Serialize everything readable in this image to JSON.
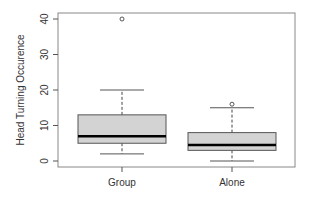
{
  "chart_data": {
    "type": "boxplot",
    "title": "",
    "xlabel": "",
    "ylabel": "Head Turning Occurence",
    "ylim": [
      -1.5,
      42
    ],
    "yticks": [
      0,
      10,
      20,
      30,
      40
    ],
    "ytick_labels": [
      "0",
      "10",
      "20",
      "30",
      "40"
    ],
    "grid": false,
    "legend": null,
    "categories": [
      "Group",
      "Alone"
    ],
    "series": [
      {
        "name": "Group",
        "whisker_low": 2,
        "q1": 5,
        "median": 7,
        "q3": 13,
        "whisker_high": 20,
        "outliers": [
          40
        ]
      },
      {
        "name": "Alone",
        "whisker_low": 0,
        "q1": 3,
        "median": 4.5,
        "q3": 8,
        "whisker_high": 15,
        "outliers": [
          16
        ]
      }
    ],
    "colors": {
      "box_fill": "#d3d3d3",
      "box_border": "#555555",
      "median": "#000000",
      "frame": "#888888"
    }
  }
}
